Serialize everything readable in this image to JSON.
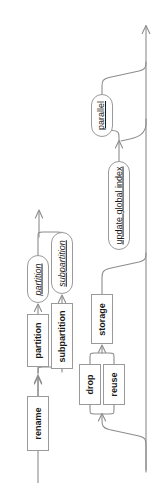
{
  "diagram": {
    "kind": "railroad-syntax-diagram",
    "orientation": "rotated-90-counterclockwise",
    "width": 165,
    "height": 483,
    "colors": {
      "background": "#ffffff",
      "rail": "#8c8c8c",
      "node_border": "#9a9a9a",
      "node_fill": "#ffffff",
      "text": "#1a1a1a"
    },
    "nodes": [
      {
        "id": "rename",
        "label": "rename",
        "type": "terminal",
        "x": 27,
        "y": 396,
        "w": 22,
        "h": 55
      },
      {
        "id": "partition-kw",
        "label": "partition",
        "type": "terminal",
        "x": 27,
        "y": 314,
        "w": 22,
        "h": 53
      },
      {
        "id": "subpartition-kw",
        "label": "subpartition",
        "type": "terminal",
        "x": 51,
        "y": 303,
        "w": 22,
        "h": 66
      },
      {
        "id": "partition-ref",
        "label": "partition",
        "type": "nonterminal",
        "x": 27,
        "y": 255,
        "w": 22,
        "h": 48
      },
      {
        "id": "subpartition-ref",
        "label": "subpartition",
        "type": "nonterminal",
        "x": 51,
        "y": 232,
        "w": 22,
        "h": 62
      },
      {
        "id": "drop",
        "label": "drop",
        "type": "terminal",
        "x": 79,
        "y": 364,
        "w": 22,
        "h": 41
      },
      {
        "id": "reuse",
        "label": "reuse",
        "type": "terminal",
        "x": 103,
        "y": 364,
        "w": 22,
        "h": 41
      },
      {
        "id": "storage",
        "label": "storage",
        "type": "terminal",
        "x": 91,
        "y": 294,
        "w": 22,
        "h": 50
      },
      {
        "id": "update-global-index",
        "label": "update global index",
        "type": "linkref",
        "x": 108,
        "y": 161,
        "w": 22,
        "h": 89
      },
      {
        "id": "parallel",
        "label": "parallel",
        "type": "linkref",
        "x": 91,
        "y": 94,
        "w": 22,
        "h": 43
      }
    ],
    "entry": {
      "id": "entry-arrow",
      "label": "entry",
      "x": 38,
      "y": 478
    },
    "exits": [
      {
        "id": "main-exit-arrow",
        "label": "exit",
        "x": 148,
        "y": 26
      },
      {
        "id": "branch-exit-arrow",
        "label": "branch-exit",
        "x": 39,
        "y": 212
      }
    ],
    "rails": [
      "M38,483 L38,451",
      "M38,396 L38,374 M34.5,381 L38,374 L41.5,381",
      "M38,374 L38,367",
      "M38,367 L38,369 C38,374 38,374 43,374 L57,374 C62,374 62,374 62,369 L62,369",
      "M38,314 L38,303 M34.5,310 L38,303 L41.5,310",
      "M62,303 L62,294 M58.5,301 L62,294 L65.5,301",
      "M38,255 L38,237 C38,232 38,232 43,232 L57,232 C62,232 62,232 62,237 L62,237",
      "M39,232 L39,208 M35.5,215 L39,208 L42.5,215",
      "M90,405 L90,407 C90,412 90,412 95,412 L107,412 C112,412 112,412 112,407",
      "M101,412 L101,418 C101,424 101,424 107,426 L140,432 C146,434 146,434 146,440 L146,470",
      "M90,364 L102,352 M90,364 L90,352 C90,347 90,347 95,347 L109,347 C114,347 114,347 114,352 L114,364",
      "M102,352 L102,344 M98.5,351 L102,344 L105.5,351",
      "M102,294 L102,272 C102,266 102,266 108,264 L140,258 C146,256 146,256 146,250",
      "M119,161 L119,140 M115.5,147 L119,140 L122.5,147",
      "M119,140 L119,137 C119,132 119,132 114,132 L107,132 C102,132 102,132 102,127",
      "M102,94 L102,88 C102,83 102,83 107,81 L140,75 C146,73 146,73 146,67",
      "M119,140 L124,138 C140,134 140,134 145,128 L146,120",
      "M146,470 L146,26",
      "M142.5,33 L146,26 L149.5,33"
    ]
  }
}
